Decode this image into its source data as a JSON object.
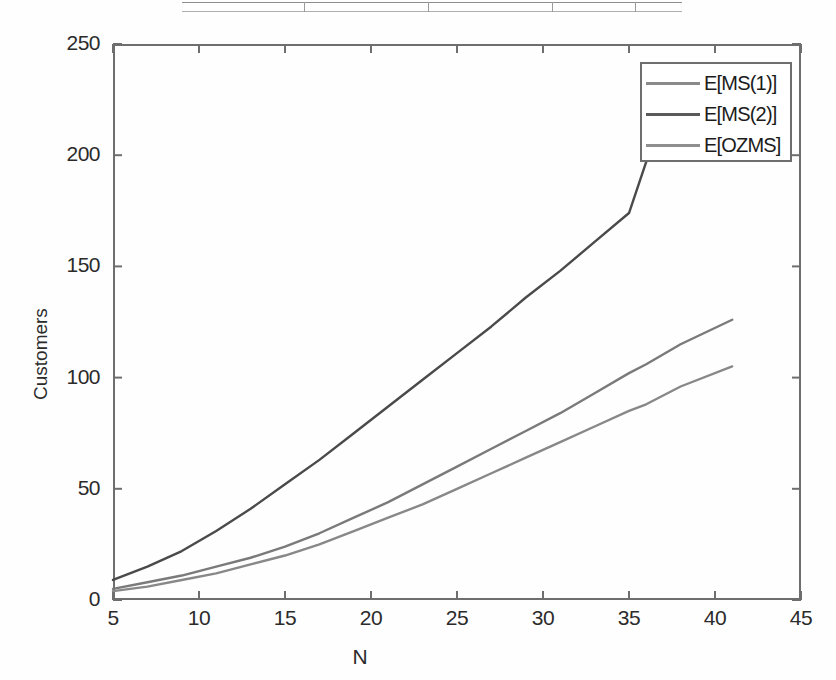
{
  "chart_data": {
    "type": "line",
    "title": "",
    "xlabel": "N",
    "ylabel": "Customers",
    "xlim": [
      5,
      45
    ],
    "ylim": [
      0,
      250
    ],
    "xticks": [
      5,
      10,
      15,
      20,
      25,
      30,
      35,
      40,
      45
    ],
    "yticks": [
      0,
      50,
      100,
      150,
      200,
      250
    ],
    "grid": false,
    "legend_position": "upper right",
    "x": [
      5,
      7,
      9,
      11,
      13,
      15,
      17,
      19,
      21,
      23,
      25,
      27,
      29,
      31,
      33,
      35,
      36,
      38,
      41
    ],
    "series": [
      {
        "name": "E[MS(1)]",
        "color": "#7a7a7a",
        "values": [
          5,
          8,
          11,
          15,
          19,
          24,
          30,
          37,
          44,
          52,
          60,
          68,
          76,
          84,
          93,
          102,
          106,
          115,
          126
        ]
      },
      {
        "name": "E[MS(2)]",
        "color": "#4a4a4a",
        "values": [
          9,
          15,
          22,
          31,
          41,
          52,
          63,
          75,
          87,
          99,
          111,
          123,
          136,
          148,
          161,
          174,
          197,
          215,
          232
        ]
      },
      {
        "name": "E[OZMS]",
        "color": "#888888",
        "values": [
          4,
          6,
          9,
          12,
          16,
          20,
          25,
          31,
          37,
          43,
          50,
          57,
          64,
          71,
          78,
          85,
          88,
          96,
          105
        ]
      }
    ]
  },
  "axes": {
    "y_tick_labels": [
      "250",
      "200",
      "150",
      "100",
      "50",
      "0"
    ],
    "x_tick_labels": [
      "5",
      "10",
      "15",
      "20",
      "25",
      "30",
      "35",
      "40",
      "45"
    ],
    "x_title": "N",
    "y_title": "Customers"
  },
  "legend": {
    "entries": [
      {
        "label": "E[MS(1)]",
        "color": "#8a8a8a"
      },
      {
        "label": "E[MS(2)]",
        "color": "#5a5a5a"
      },
      {
        "label": "E[OZMS]",
        "color": "#8f8f8f"
      }
    ]
  }
}
